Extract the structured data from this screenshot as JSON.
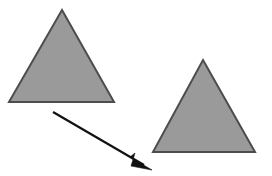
{
  "canvas": {
    "width": 272,
    "height": 176,
    "background_color": "#ffffff",
    "title": "Translation of a triangle"
  },
  "style": {
    "shape_fill_color": "#9a9a9a",
    "shape_stroke_color": "#4d4d4d",
    "shape_stroke_width": 2,
    "arrow_color": "#111111",
    "arrow_stroke_width": 2.2
  },
  "shapes": [
    {
      "name": "source-triangle",
      "type": "triangle",
      "label": "",
      "points": "62,10 114,102 9,102",
      "apex": [
        62,
        10
      ],
      "base_left": [
        9,
        102
      ],
      "base_right": [
        114,
        102
      ],
      "fill": "#9a9a9a",
      "stroke": "#4d4d4d"
    },
    {
      "name": "target-triangle",
      "type": "triangle",
      "label": "",
      "points": "203,60 255,152 153,152",
      "apex": [
        203,
        60
      ],
      "base_left": [
        153,
        152
      ],
      "base_right": [
        255,
        152
      ],
      "fill": "#9a9a9a",
      "stroke": "#4d4d4d"
    }
  ],
  "arrow": {
    "name": "translation-arrow",
    "label": "",
    "start": [
      53,
      112
    ],
    "end": [
      152,
      170
    ],
    "shaft_end": [
      139,
      162
    ],
    "head_points": "152,170 130,157 135,153 131,166",
    "color": "#111111",
    "stroke_width": 2.2
  }
}
